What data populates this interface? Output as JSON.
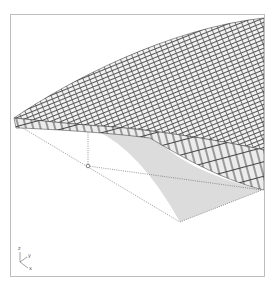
{
  "figure": {
    "colors": {
      "frame": "#bdbdbd",
      "brick_face": "#f4f4f4",
      "brick_shadow": "#8a8a8a",
      "brick_edge": "#333333",
      "projection_fill": "#dcdcdc",
      "construction_line": "#555555"
    }
  },
  "axes_gizmo": {
    "z_label": "z",
    "y_label": "y",
    "x_label": "x"
  }
}
